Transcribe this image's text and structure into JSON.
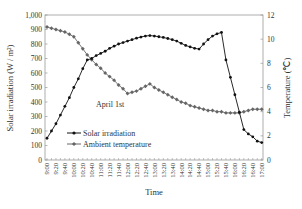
{
  "chart_data": {
    "type": "line",
    "title": "",
    "annotation": "April 1st",
    "xlabel": "Time",
    "ylabel": "Solar irradiation (W / m²)",
    "ylabel_right": "Temperature (℃)",
    "ylim": [
      0,
      1000
    ],
    "ylim_right": [
      0,
      12
    ],
    "yticks": [
      "0",
      "100",
      "200",
      "300",
      "400",
      "500",
      "600",
      "700",
      "800",
      "900",
      "1,000"
    ],
    "yticks_right": [
      "0",
      "2",
      "4",
      "6",
      "8",
      "10",
      "12"
    ],
    "xtick_labels": [
      "9:00",
      "9:20",
      "9:40",
      "10:00",
      "10:20",
      "10:40",
      "11:00",
      "11:20",
      "11:40",
      "12:00",
      "12:20",
      "12:40",
      "13:00",
      "13:20",
      "13:40",
      "14:00",
      "14:20",
      "14:40",
      "15:00",
      "15:20",
      "15:40",
      "16:00",
      "16:20",
      "16:40",
      "17:00"
    ],
    "x": [
      "9:00",
      "9:10",
      "9:20",
      "9:30",
      "9:40",
      "9:50",
      "10:00",
      "10:10",
      "10:20",
      "10:30",
      "10:40",
      "10:50",
      "11:00",
      "11:10",
      "11:20",
      "11:30",
      "11:40",
      "11:50",
      "12:00",
      "12:10",
      "12:20",
      "12:30",
      "12:40",
      "12:50",
      "13:00",
      "13:10",
      "13:20",
      "13:30",
      "13:40",
      "13:50",
      "14:00",
      "14:10",
      "14:20",
      "14:30",
      "14:40",
      "14:50",
      "15:00",
      "15:10",
      "15:20",
      "15:30",
      "15:40",
      "15:50",
      "16:00",
      "16:10",
      "16:20",
      "16:30",
      "16:40",
      "16:50",
      "17:00"
    ],
    "grid": false,
    "legend_position": "lower-left-inside",
    "series": [
      {
        "name": "Solar irradiation",
        "axis": "left",
        "marker": "circle",
        "color": "#111111",
        "values": [
          150,
          200,
          250,
          310,
          370,
          430,
          500,
          560,
          630,
          690,
          700,
          720,
          735,
          750,
          770,
          785,
          800,
          810,
          820,
          830,
          840,
          848,
          855,
          858,
          855,
          850,
          845,
          838,
          830,
          820,
          805,
          790,
          780,
          770,
          765,
          800,
          830,
          855,
          870,
          880,
          690,
          570,
          450,
          330,
          210,
          180,
          160,
          130,
          120
        ]
      },
      {
        "name": "Ambient temperature",
        "axis": "right",
        "marker": "diamond",
        "color": "#666666",
        "values": [
          11.0,
          10.9,
          10.8,
          10.7,
          10.6,
          10.4,
          10.2,
          9.7,
          9.2,
          8.7,
          8.3,
          7.9,
          7.6,
          7.2,
          6.9,
          6.6,
          6.2,
          5.9,
          5.5,
          5.6,
          5.7,
          5.9,
          6.1,
          6.3,
          6.0,
          5.8,
          5.6,
          5.4,
          5.2,
          5.0,
          4.8,
          4.7,
          4.5,
          4.4,
          4.3,
          4.2,
          4.1,
          4.1,
          4.0,
          4.0,
          3.9,
          3.9,
          3.9,
          3.9,
          4.0,
          4.1,
          4.2,
          4.2,
          4.2
        ]
      }
    ]
  }
}
